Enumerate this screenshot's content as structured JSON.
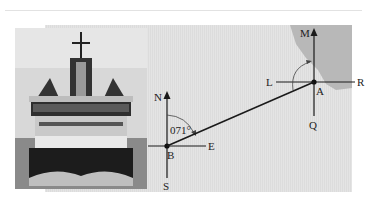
{
  "figure": {
    "photo": {
      "subject": "ship-stern-view"
    },
    "diagram": {
      "point_a": {
        "label": "A",
        "axes": {
          "north": "M",
          "south": "Q",
          "west": "L",
          "east": "R"
        }
      },
      "point_b": {
        "label": "B",
        "axes": {
          "north": "N",
          "south": "S",
          "east": "E"
        }
      },
      "bearing_label": "071°",
      "colors": {
        "sea": "#e0e0e0",
        "land": "#b4b4b4",
        "line": "#1a1a1a"
      }
    }
  }
}
